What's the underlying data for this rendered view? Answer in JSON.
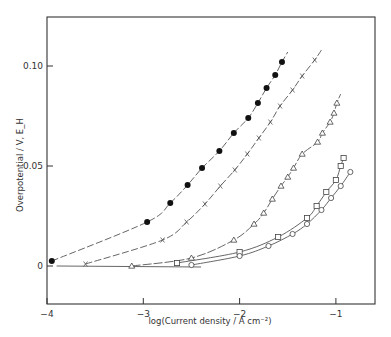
{
  "chart_data": {
    "type": "scatter",
    "title": "",
    "xlabel": "log(Current density / A cm⁻²)",
    "ylabel": "Overpotential / V, E_H",
    "xlim": [
      -4,
      -0.6
    ],
    "ylim": [
      -0.013,
      0.115
    ],
    "x_ticks": [
      -4,
      -3,
      -2,
      -1
    ],
    "x_tick_labels": [
      "−4",
      "−3",
      "−2",
      "−1"
    ],
    "y_ticks": [
      0,
      0.05,
      0.1
    ],
    "y_tick_labels": [
      "0",
      "0.05",
      "0.10"
    ],
    "grid": false,
    "legend": null,
    "series": [
      {
        "name": "filled circles",
        "marker": "filled-circle",
        "x": [
          -3.95,
          -2.96,
          -2.72,
          -2.54,
          -2.39,
          -2.21,
          -2.06,
          -1.91,
          -1.81,
          -1.72,
          -1.63,
          -1.56
        ],
        "y": [
          0.0025,
          0.022,
          0.0315,
          0.0405,
          0.049,
          0.0575,
          0.0665,
          0.074,
          0.0815,
          0.089,
          0.0955,
          0.102
        ],
        "curve_extends_to": [
          -1.5,
          0.107
        ]
      },
      {
        "name": "crosses",
        "marker": "cross",
        "x": [
          -3.6,
          -2.8,
          -2.55,
          -2.36,
          -2.2,
          -2.05,
          -1.92,
          -1.8,
          -1.68,
          -1.58,
          -1.45,
          -1.35,
          -1.22
        ],
        "y": [
          0.001,
          0.013,
          0.022,
          0.031,
          0.04,
          0.048,
          0.056,
          0.064,
          0.072,
          0.08,
          0.088,
          0.095,
          0.103
        ],
        "curve_extends_to": [
          -1.15,
          0.108
        ]
      },
      {
        "name": "open triangles",
        "marker": "triangle",
        "x": [
          -3.12,
          -2.5,
          -2.06,
          -1.85,
          -1.75,
          -1.66,
          -1.57,
          -1.5,
          -1.44,
          -1.35,
          -1.19,
          -1.14,
          -1.06,
          -1.02,
          -0.99
        ],
        "y": [
          0.0,
          0.004,
          0.013,
          0.021,
          0.0265,
          0.0335,
          0.04,
          0.0445,
          0.049,
          0.056,
          0.062,
          0.0665,
          0.072,
          0.0765,
          0.0815
        ],
        "curve_extends_to": [
          -0.95,
          0.086
        ]
      },
      {
        "name": "open squares",
        "marker": "square",
        "x": [
          -2.65,
          -2.0,
          -1.6,
          -1.3,
          -1.2,
          -1.1,
          -1.0,
          -0.95,
          -0.92
        ],
        "y": [
          0.0015,
          0.007,
          0.0145,
          0.024,
          0.03,
          0.037,
          0.043,
          0.05,
          0.054
        ]
      },
      {
        "name": "open circles / diamonds",
        "marker": "circle",
        "x": [
          -2.5,
          -2.0,
          -1.7,
          -1.45,
          -1.3,
          -1.15,
          -1.05,
          -0.95,
          -0.85
        ],
        "y": [
          0.0005,
          0.005,
          0.01,
          0.016,
          0.021,
          0.028,
          0.034,
          0.04,
          0.047
        ]
      }
    ],
    "baseline": {
      "y": 0.0,
      "x_range": [
        -3.9,
        -2.4
      ]
    }
  },
  "colors": {
    "ink": "#333333",
    "background": "#ffffff"
  }
}
